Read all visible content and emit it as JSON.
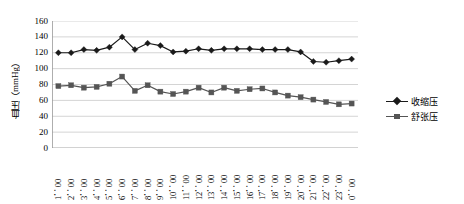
{
  "chart_data": {
    "type": "line",
    "title": "",
    "subtitle": "",
    "xlabel": "",
    "ylabel": "血压（mmHg）",
    "ylim": [
      0,
      160
    ],
    "ytick_step": 20,
    "yticks": [
      "160",
      "140",
      "120",
      "100",
      "80",
      "60",
      "40",
      "20",
      "0"
    ],
    "grid": true,
    "grid_axis": "y",
    "legend_position": "right",
    "categories": [
      "1：00",
      "2：00",
      "3：00",
      "4：00",
      "5：00",
      "6：00",
      "7：00",
      "8：00",
      "9：00",
      "10：00",
      "11：00",
      "12：00",
      "13：00",
      "14：00",
      "15：00",
      "16：00",
      "17：00",
      "18：00",
      "19：00",
      "20：00",
      "21：00",
      "22：00",
      "23：00",
      "0：00"
    ],
    "series": [
      {
        "name": "收缩压",
        "marker": "diamond",
        "color": "#1a1a1a",
        "values": [
          120,
          120,
          124,
          123,
          127,
          140,
          124,
          132,
          129,
          121,
          122,
          125,
          123,
          125,
          125,
          125,
          124,
          124,
          124,
          121,
          109,
          108,
          110,
          112
        ]
      },
      {
        "name": "舒张压",
        "marker": "square",
        "color": "#555555",
        "values": [
          78,
          79,
          76,
          77,
          81,
          90,
          72,
          79,
          71,
          68,
          71,
          76,
          70,
          76,
          72,
          74,
          75,
          70,
          66,
          64,
          61,
          58,
          55,
          56
        ]
      }
    ],
    "legend": [
      {
        "label": "收缩压",
        "marker": "diamond",
        "color": "#1a1a1a"
      },
      {
        "label": "舒张压",
        "marker": "square",
        "color": "#555555"
      }
    ],
    "colors": {
      "systolic": "#1a1a1a",
      "diastolic": "#555555",
      "grid": "#c9c9c9",
      "axis": "#9a9a9a",
      "plot_background": "#ffffff"
    }
  }
}
